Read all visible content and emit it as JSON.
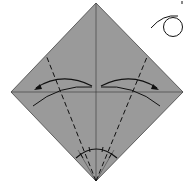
{
  "diagram": {
    "type": "origami-step",
    "paper_color": "#9a9a9a",
    "line_color": "#222222",
    "background": "#ffffff",
    "elements": [
      {
        "name": "square-paper-diamond",
        "description": "square paper rotated 45 degrees, colored side up"
      },
      {
        "name": "vertical-crease",
        "description": "existing center crease top to bottom"
      },
      {
        "name": "horizontal-crease",
        "description": "existing center crease left to right"
      },
      {
        "name": "valley-fold-left",
        "description": "dashed valley fold line from bottom corner to upper-left edge"
      },
      {
        "name": "valley-fold-right",
        "description": "dashed valley fold line from bottom corner to upper-right edge"
      },
      {
        "name": "fold-arrow-left",
        "description": "curved arrow folding left edge toward center"
      },
      {
        "name": "fold-arrow-right",
        "description": "curved arrow folding right edge toward center"
      },
      {
        "name": "angle-trisection-marks",
        "description": "arc at bottom corner with tick marks showing equal angles"
      },
      {
        "name": "turn-over-symbol",
        "description": "loop arrow symbol in top-right indicating turn over"
      }
    ]
  }
}
